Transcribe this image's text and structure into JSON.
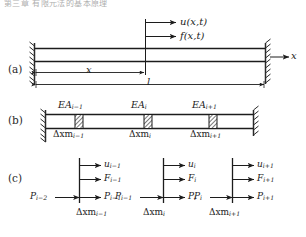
{
  "figure": {
    "top_caption": "第三章 有限元法的基本原理",
    "panels": [
      {
        "id": "a",
        "label": "(a)"
      },
      {
        "id": "b",
        "label": "(b)"
      },
      {
        "id": "c",
        "label": "(c)"
      }
    ]
  },
  "panel_a": {
    "load_labels": {
      "displacement": "u(x,t)",
      "force": "f(x,t)"
    },
    "axis_label": "x",
    "dimensions": {
      "position": "x",
      "length": "l"
    }
  },
  "panel_b": {
    "stiffness_labels": [
      {
        "base": "EA",
        "sub": "i−1"
      },
      {
        "base": "EA",
        "sub": "i"
      },
      {
        "base": "EA",
        "sub": "i+1"
      }
    ],
    "mass_labels": [
      {
        "base": "Δxm",
        "sub": "i−1"
      },
      {
        "base": "Δxm",
        "sub": "i"
      },
      {
        "base": "Δxm",
        "sub": "i+1"
      }
    ]
  },
  "panel_c": {
    "elements": [
      {
        "u": {
          "base": "u",
          "sub": "i−1"
        },
        "F": {
          "base": "F",
          "sub": "i−1"
        },
        "p_left": {
          "base": "P",
          "sub": "i−2"
        },
        "p_right": {
          "base": "P",
          "sub": "i−1"
        },
        "mass": {
          "base": "Δxm",
          "sub": "i−1"
        }
      },
      {
        "u": {
          "base": "u",
          "sub": "i"
        },
        "F": {
          "base": "F",
          "sub": "i"
        },
        "p_left": {
          "base": "P",
          "sub": "i−1"
        },
        "p_right": {
          "base": "P",
          "sub": "i"
        },
        "mass": {
          "base": "Δxm",
          "sub": "i"
        }
      },
      {
        "u": {
          "base": "u",
          "sub": "i+1"
        },
        "F": {
          "base": "F",
          "sub": "i+1"
        },
        "p_left": {
          "base": "P",
          "sub": "i"
        },
        "p_right": {
          "base": "P",
          "sub": "i+1"
        },
        "mass": {
          "base": "Δxm",
          "sub": "i+1"
        }
      }
    ]
  },
  "colors": {
    "line": "#1c1c1c",
    "wall": "#2a2a2a",
    "hatch": "#333333",
    "background": "#ffffff"
  }
}
